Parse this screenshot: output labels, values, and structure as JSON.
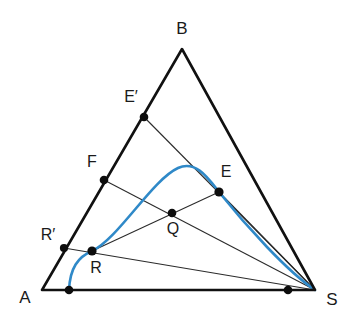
{
  "figure": {
    "background_color": "#ffffff",
    "width": 353,
    "height": 324
  },
  "colors": {
    "triangle_stroke": "#111111",
    "cevian_stroke": "#2b2b2b",
    "curve_stroke": "#2f89c8",
    "point_fill": "#0d0d0d",
    "label_fill": "#1a1a1a"
  },
  "vertices": [
    {
      "id": "A",
      "label": "A",
      "x": 42,
      "y": 290,
      "label_x": 25,
      "label_y": 299
    },
    {
      "id": "B",
      "label": "B",
      "x": 182,
      "y": 49,
      "label_x": 182,
      "label_y": 30
    },
    {
      "id": "S",
      "label": "S",
      "x": 315,
      "y": 290,
      "label_x": 332,
      "label_y": 301
    }
  ],
  "triangle": {
    "name": "triangle-ABS",
    "points": "42,290 182,49 315,290",
    "stroke_width": 2.6
  },
  "points": [
    {
      "id": "Eprime",
      "label": "E′",
      "x": 144,
      "y": 117,
      "label_x": 131,
      "label_y": 98,
      "radius": 4.3
    },
    {
      "id": "F",
      "label": "F",
      "x": 104,
      "y": 180,
      "label_x": 92,
      "label_y": 163,
      "radius": 4.3
    },
    {
      "id": "E",
      "label": "E",
      "x": 219,
      "y": 192,
      "label_x": 226,
      "label_y": 173,
      "radius": 4.6
    },
    {
      "id": "Rprime",
      "label": "R′",
      "x": 64,
      "y": 248,
      "label_x": 48,
      "label_y": 236,
      "radius": 4.1
    },
    {
      "id": "Q",
      "label": "Q",
      "x": 172,
      "y": 213,
      "label_x": 173,
      "label_y": 230,
      "radius": 4.3
    },
    {
      "id": "R",
      "label": "R",
      "x": 92,
      "y": 251,
      "label_x": 96,
      "label_y": 269,
      "radius": 4.6
    },
    {
      "id": "T",
      "label": "",
      "x": 69,
      "y": 290,
      "label_x": 0,
      "label_y": 0,
      "radius": 4.3
    },
    {
      "id": "U",
      "label": "",
      "x": 288,
      "y": 290,
      "label_x": 0,
      "label_y": 0,
      "radius": 4.3
    }
  ],
  "segments": [
    {
      "id": "Eprime-S",
      "from": "E′",
      "to": "S",
      "x1": 144,
      "y1": 117,
      "x2": 315,
      "y2": 290,
      "stroke_width": 1.1
    },
    {
      "id": "F-S",
      "from": "F",
      "to": "S",
      "x1": 104,
      "y1": 180,
      "x2": 315,
      "y2": 290,
      "stroke_width": 1.1
    },
    {
      "id": "Rprime-S",
      "from": "R′",
      "to": "S",
      "x1": 64,
      "y1": 248,
      "x2": 315,
      "y2": 290,
      "stroke_width": 1.1
    },
    {
      "id": "R-E",
      "from": "R",
      "to": "E",
      "x1": 92,
      "y1": 251,
      "x2": 219,
      "y2": 192,
      "stroke_width": 1.1
    },
    {
      "id": "E-S",
      "from": "E",
      "to": "S",
      "x1": 219,
      "y1": 192,
      "x2": 315,
      "y2": 290,
      "stroke_width": 1.1
    },
    {
      "id": "A-U",
      "from": "A",
      "to": "U",
      "x1": 42,
      "y1": 290,
      "x2": 315,
      "y2": 290,
      "stroke_width": 1.6
    }
  ],
  "curve": {
    "id": "blue-parabola",
    "description": "parabolic arc tangent to AB near R and passing through E down to S",
    "path": "M 69,290 C 70,268 78,257 92,251 C 118,239 152,180 178,168 C 196,160 208,178 219,192 C 246,226 288,272 315,290",
    "stroke_width": 2.6
  }
}
